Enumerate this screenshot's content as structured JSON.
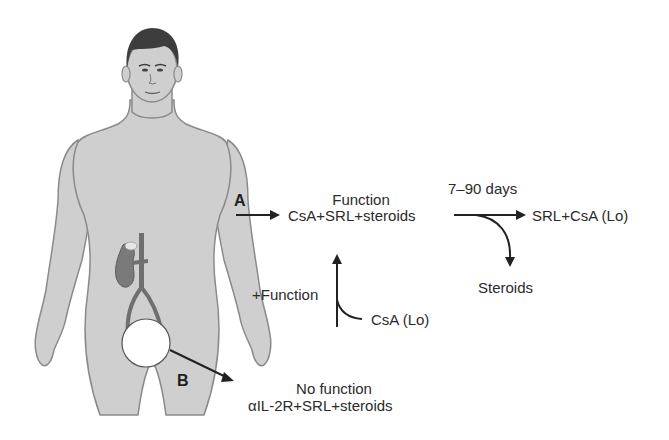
{
  "figure": {
    "colors": {
      "skin": "#cfcfcf",
      "outline": "#8a8a8a",
      "hair": "#3d3d3d",
      "kidney": "#7a7a7a",
      "vessel": "#6f6f6f",
      "arrow": "#222222",
      "text": "#2b2b2b"
    }
  },
  "labels": {
    "path_a": "A",
    "path_b": "B",
    "a_status": "Function",
    "a_regimen": "CsA+SRL+steroids",
    "timeframe": "7–90 days",
    "maintenance": "SRL+CsA (Lo)",
    "withdrawn": "Steroids",
    "plus_function": "+Function",
    "added": "CsA (Lo)",
    "b_status": "No function",
    "b_regimen": "αIL-2R+SRL+steroids"
  }
}
